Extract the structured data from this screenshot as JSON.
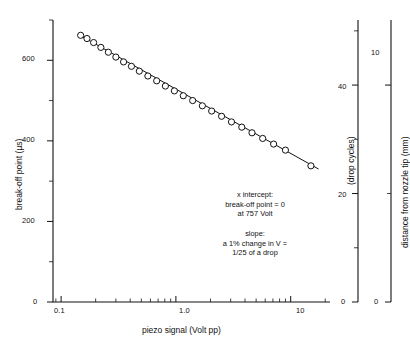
{
  "chart_data": {
    "type": "scatter",
    "title": "",
    "xlabel": "piezo signal (Volt pp)",
    "ylabel": "break-off point (µs)",
    "xscale": "log",
    "yscale": "linear",
    "xlim": [
      0.085,
      22
    ],
    "ylim": [
      0,
      700
    ],
    "grid": false,
    "legend": null,
    "xticks": [
      0.1,
      1.0,
      10
    ],
    "xtick_labels": [
      "0.1",
      "1.0",
      "10"
    ],
    "yticks": [
      0,
      100,
      200,
      300,
      400,
      500,
      600,
      700
    ],
    "ytick_labels": [
      "0",
      "",
      "200",
      "",
      "400",
      "",
      "600",
      ""
    ],
    "series": [
      {
        "name": "break-off point measurements",
        "marker": "open-circle",
        "x": [
          0.148,
          0.168,
          0.192,
          0.222,
          0.258,
          0.3,
          0.35,
          0.41,
          0.48,
          0.57,
          0.68,
          0.81,
          0.97,
          1.16,
          1.4,
          1.7,
          2.05,
          2.5,
          3.05,
          3.75,
          4.6,
          5.7,
          7.1,
          9.0,
          15.0
        ],
        "y": [
          662,
          654,
          644,
          632,
          620,
          608,
          596,
          585,
          573,
          561,
          549,
          536,
          524,
          512,
          500,
          487,
          474,
          461,
          447,
          434,
          420,
          406,
          392,
          377,
          338
        ]
      }
    ],
    "fit_line": {
      "name": "least-squares fit",
      "x": [
        0.15,
        17.5
      ],
      "y": [
        660,
        330
      ],
      "x_intercept_volt": 757,
      "y_at_intercept": 0
    },
    "secondary_axes": [
      {
        "name": "drop-cycles-axis",
        "label": "(drop cycles)",
        "ticks": [
          0,
          10,
          20,
          30,
          40,
          50
        ],
        "tick_labels": [
          "0",
          "",
          "20",
          "",
          "40",
          ""
        ],
        "lim": [
          0,
          52
        ]
      },
      {
        "name": "nozzle-distance-axis",
        "label": "distance from nozzle tip (mm)",
        "ticks": [
          0,
          5,
          10
        ],
        "tick_labels": [
          "0",
          "",
          "10"
        ],
        "lim": [
          0,
          13
        ]
      }
    ],
    "annotations": [
      {
        "name": "x-intercept-note",
        "lines": [
          "x intercept:",
          "break-off point = 0",
          "at 757 Volt"
        ]
      },
      {
        "name": "slope-note",
        "lines": [
          "slope:",
          "a 1% change in V =",
          "1/25 of  a drop"
        ]
      }
    ]
  },
  "axes": {
    "left": {
      "title": "break-off point (µs)",
      "labels": [
        "0",
        "200",
        "400",
        "600"
      ]
    },
    "bottom": {
      "title": "piezo signal (Volt pp)",
      "labels": [
        "0.1",
        "1.0",
        "10"
      ]
    },
    "right_inner": {
      "title": "(drop cycles)",
      "labels": [
        "0",
        "20",
        "40"
      ]
    },
    "right_outer": {
      "title": "distance from nozzle tip (mm)",
      "labels": [
        "0",
        "10"
      ]
    }
  },
  "annotation_block_1": {
    "line1": "x intercept:",
    "line2": "break-off point = 0",
    "line3": "at 757 Volt"
  },
  "annotation_block_2": {
    "line1": "slope:",
    "line2": "a 1% change in V =",
    "line3": "1/25 of  a drop"
  },
  "colors": {
    "ink": "#111111",
    "background": "#ffffff",
    "marker_fill": "#ffffff"
  }
}
